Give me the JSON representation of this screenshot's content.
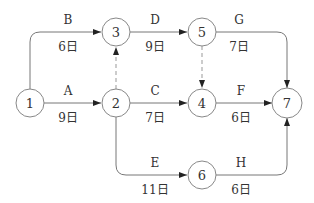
{
  "diagram": {
    "type": "activity-on-arrow network",
    "nodes": [
      {
        "id": "1",
        "x": 30,
        "y": 103
      },
      {
        "id": "2",
        "x": 116,
        "y": 103
      },
      {
        "id": "3",
        "x": 116,
        "y": 32
      },
      {
        "id": "4",
        "x": 202,
        "y": 103
      },
      {
        "id": "5",
        "x": 202,
        "y": 32
      },
      {
        "id": "6",
        "x": 202,
        "y": 175
      },
      {
        "id": "7",
        "x": 287,
        "y": 103
      }
    ],
    "activities": [
      {
        "name": "A",
        "from": "1",
        "to": "2",
        "duration": "9日"
      },
      {
        "name": "B",
        "from": "1",
        "to": "3",
        "duration": "6日"
      },
      {
        "name": "C",
        "from": "2",
        "to": "4",
        "duration": "7日"
      },
      {
        "name": "D",
        "from": "3",
        "to": "5",
        "duration": "9日"
      },
      {
        "name": "E",
        "from": "2",
        "to": "6",
        "duration": "11日"
      },
      {
        "name": "F",
        "from": "4",
        "to": "7",
        "duration": "6日"
      },
      {
        "name": "G",
        "from": "5",
        "to": "7",
        "duration": "7日"
      },
      {
        "name": "H",
        "from": "6",
        "to": "7",
        "duration": "6日"
      }
    ],
    "dummies": [
      {
        "from": "2",
        "to": "3"
      },
      {
        "from": "5",
        "to": "4"
      }
    ]
  }
}
